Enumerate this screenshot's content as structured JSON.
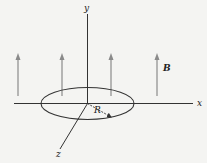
{
  "diagram": {
    "axes": {
      "x_label": "x",
      "y_label": "y",
      "z_label": "z"
    },
    "field_label": "B",
    "radius_label": "R",
    "field_arrow_count": 4,
    "colors": {
      "background": "#f4f4f2",
      "axes": "#333333",
      "field_arrows": "#8a8a8a",
      "loop": "#333333"
    }
  }
}
